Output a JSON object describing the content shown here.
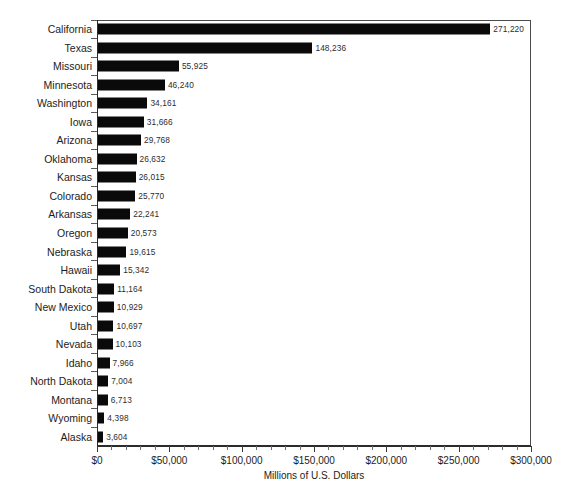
{
  "chart_data": {
    "type": "bar",
    "orientation": "horizontal",
    "title": "",
    "xlabel": "Millions of U.S. Dollars",
    "ylabel": "",
    "xlim": [
      0,
      300000
    ],
    "xtick_labels": [
      "$0",
      "$50,000",
      "$100,000",
      "$150,000",
      "$200,000",
      "$250,000",
      "$300,000"
    ],
    "xtick_values": [
      0,
      50000,
      100000,
      150000,
      200000,
      250000,
      300000
    ],
    "xtick_minor_step": 10000,
    "grid": false,
    "legend": null,
    "bar_color": "#0a0a0a",
    "categories": [
      "California",
      "Texas",
      "Missouri",
      "Minnesota",
      "Washington",
      "Iowa",
      "Arizona",
      "Oklahoma",
      "Kansas",
      "Colorado",
      "Arkansas",
      "Oregon",
      "Nebraska",
      "Hawaii",
      "South Dakota",
      "New Mexico",
      "Utah",
      "Nevada",
      "Idaho",
      "North Dakota",
      "Montana",
      "Wyoming",
      "Alaska"
    ],
    "values": [
      271220,
      148236,
      55925,
      46240,
      34161,
      31666,
      29768,
      26632,
      26015,
      25770,
      22241,
      20573,
      19615,
      15342,
      11164,
      10929,
      10697,
      10103,
      7966,
      7004,
      6713,
      4398,
      3604
    ],
    "data_labels": [
      "271,220",
      "148,236",
      "55,925",
      "46,240",
      "34,161",
      "31,666",
      "29,768",
      "26,632",
      "26,015",
      "25,770",
      "22,241",
      "20,573",
      "19,615",
      "15,342",
      "11,164",
      "10,929",
      "10,697",
      "10,103",
      "7,966",
      "7,004",
      "6,713",
      "4,398",
      "3,604"
    ]
  }
}
